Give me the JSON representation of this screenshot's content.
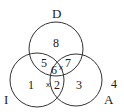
{
  "diagram": {
    "type": "venn",
    "sets": [
      {
        "label": "D",
        "cx": 56,
        "cy": 49,
        "r": 27
      },
      {
        "label": "I",
        "cx": 37,
        "cy": 80,
        "r": 27
      },
      {
        "label": "A",
        "cx": 76,
        "cy": 80,
        "r": 26
      }
    ],
    "set_labels": {
      "D": "D",
      "I": "I",
      "A": "A"
    },
    "regions": {
      "only_D": "8",
      "D_and_I": "5",
      "D_and_A": "7",
      "D_I_A": "6",
      "only_I": "1",
      "I_and_A": "2",
      "only_A": "3",
      "outside": "4"
    },
    "marks": {
      "mark1": "x",
      "mark2": "x"
    }
  }
}
